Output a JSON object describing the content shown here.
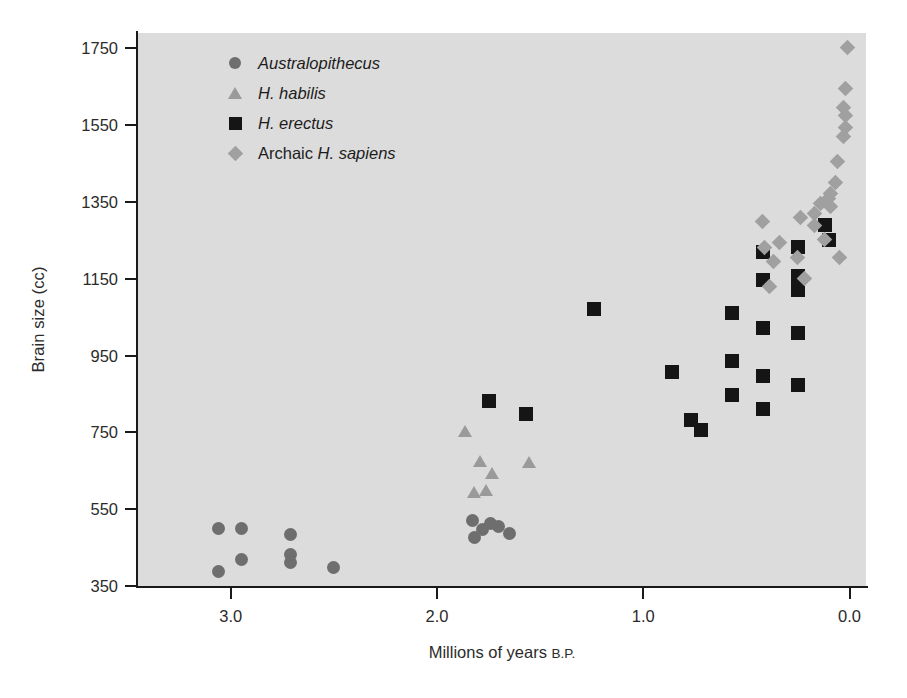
{
  "chart_data": {
    "type": "scatter",
    "title": "",
    "xlabel": "Millions of years B.P.",
    "xlabel_main": "Millions of years ",
    "xlabel_smallcaps": "B.P.",
    "ylabel": "Brain size (cc)",
    "xlim": [
      3.45,
      -0.08
    ],
    "ylim": [
      350,
      1790
    ],
    "x_reversed": true,
    "grid": false,
    "legend_position": "top-left-inside",
    "xticks": [
      "3.0",
      "2.0",
      "1.0",
      "0.0"
    ],
    "xtick_values": [
      3.0,
      2.0,
      1.0,
      0.0
    ],
    "yticks": [
      "350",
      "550",
      "750",
      "950",
      "1150",
      "1350",
      "1550",
      "1750"
    ],
    "ytick_values": [
      350,
      550,
      750,
      950,
      1150,
      1350,
      1550,
      1750
    ],
    "plot_background": "#dcdcdc",
    "axis_color": "#1a1a1a",
    "series": [
      {
        "name": "Australopithecus",
        "label_italic": true,
        "marker": "circle",
        "color": "#6e6e6e",
        "size": 13,
        "points": [
          [
            3.06,
            499
          ],
          [
            2.95,
            499
          ],
          [
            2.95,
            419
          ],
          [
            3.06,
            387
          ],
          [
            2.71,
            483
          ],
          [
            2.71,
            431
          ],
          [
            2.71,
            411
          ],
          [
            2.5,
            397
          ],
          [
            1.83,
            520
          ],
          [
            1.82,
            475
          ],
          [
            1.78,
            497
          ],
          [
            1.74,
            512
          ],
          [
            1.7,
            505
          ],
          [
            1.65,
            487
          ]
        ]
      },
      {
        "name": "H. habilis",
        "label_italic": true,
        "marker": "triangle",
        "color": "#9a9a9a",
        "size": 13,
        "points": [
          [
            1.86,
            752
          ],
          [
            1.79,
            674
          ],
          [
            1.73,
            644
          ],
          [
            1.82,
            595
          ],
          [
            1.76,
            600
          ],
          [
            1.55,
            672
          ]
        ]
      },
      {
        "name": "H. erectus",
        "label_italic": true,
        "marker": "square",
        "color": "#151515",
        "size": 14,
        "points": [
          [
            1.75,
            832
          ],
          [
            1.57,
            799
          ],
          [
            1.24,
            1072
          ],
          [
            0.86,
            906
          ],
          [
            0.77,
            783
          ],
          [
            0.72,
            755
          ],
          [
            0.57,
            1062
          ],
          [
            0.57,
            936
          ],
          [
            0.57,
            848
          ],
          [
            0.42,
            1219
          ],
          [
            0.42,
            1147
          ],
          [
            0.42,
            1022
          ],
          [
            0.42,
            897
          ],
          [
            0.42,
            810
          ],
          [
            0.25,
            1232
          ],
          [
            0.25,
            1158
          ],
          [
            0.25,
            1121
          ],
          [
            0.25,
            1010
          ],
          [
            0.25,
            874
          ],
          [
            0.12,
            1290
          ],
          [
            0.1,
            1250
          ]
        ]
      },
      {
        "name": "Archaic H. sapiens",
        "label_prefix": "Archaic ",
        "label_italic_part": "H. sapiens",
        "marker": "diamond",
        "color": "#a0a0a0",
        "size": 14,
        "points": [
          [
            0.01,
            1752
          ],
          [
            0.02,
            1645
          ],
          [
            0.02,
            1575
          ],
          [
            0.02,
            1543
          ],
          [
            0.03,
            1596
          ],
          [
            0.03,
            1520
          ],
          [
            0.06,
            1455
          ],
          [
            0.07,
            1400
          ],
          [
            0.09,
            1372
          ],
          [
            0.09,
            1338
          ],
          [
            0.1,
            1360
          ],
          [
            0.14,
            1345
          ],
          [
            0.17,
            1320
          ],
          [
            0.17,
            1290
          ],
          [
            0.12,
            1252
          ],
          [
            0.05,
            1205
          ],
          [
            0.34,
            1245
          ],
          [
            0.37,
            1195
          ],
          [
            0.39,
            1129
          ],
          [
            0.41,
            1232
          ],
          [
            0.42,
            1300
          ],
          [
            0.24,
            1310
          ],
          [
            0.25,
            1205
          ],
          [
            0.22,
            1150
          ]
        ]
      }
    ]
  }
}
